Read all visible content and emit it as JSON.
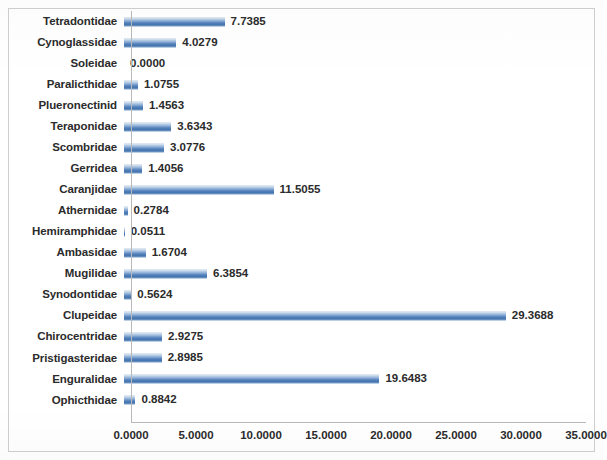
{
  "chart_data": {
    "type": "bar",
    "orientation": "horizontal",
    "title": "",
    "subtitle": "",
    "xlabel": "",
    "ylabel": "",
    "xlim": [
      0.0,
      35.0
    ],
    "xtick_step": 5.0,
    "xticks": [
      "0.0000",
      "5.0000",
      "10.0000",
      "15.0000",
      "20.0000",
      "25.0000",
      "30.0000",
      "35.0000"
    ],
    "xtick_values": [
      0,
      5,
      10,
      15,
      20,
      25,
      30,
      35
    ],
    "grid": false,
    "legend": null,
    "series_color": "#4f81bd",
    "value_label_format": "0.0000",
    "categories": [
      "Tetradontidae",
      "Cynoglassidae",
      "Soleidae",
      "Paralicthidae",
      "Plueronectinid",
      "Teraponidae",
      "Scombridae",
      "Gerridea",
      "Caranjidae",
      "Athernidae",
      "Hemiramphidae",
      "Ambasidae",
      "Mugilidae",
      "Synodontidae",
      "Clupeidae",
      "Chirocentridae",
      "Pristigasteridae",
      "Enguralidae",
      "Ophicthidae"
    ],
    "values": [
      7.7385,
      4.0279,
      0.0,
      1.0755,
      1.4563,
      3.6343,
      3.0776,
      1.4056,
      11.5055,
      0.2784,
      0.0511,
      1.6704,
      6.3854,
      0.5624,
      29.3688,
      2.9275,
      2.8985,
      19.6483,
      0.8842
    ],
    "value_labels": [
      "7.7385",
      "4.0279",
      "0.0000",
      "1.0755",
      "1.4563",
      "3.6343",
      "3.0776",
      "1.4056",
      "11.5055",
      "0.2784",
      "0.0511",
      "1.6704",
      "6.3854",
      "0.5624",
      "29.3688",
      "2.9275",
      "2.8985",
      "19.6483",
      "0.8842"
    ]
  }
}
